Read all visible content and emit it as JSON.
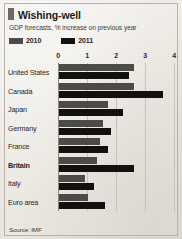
{
  "header": {
    "title": "Wishing-well",
    "subtitle": "GDP forecasts, % increase on previous year"
  },
  "legend": {
    "items": [
      {
        "label": "2010",
        "color": "#4b4a47"
      },
      {
        "label": "2011",
        "color": "#100f0e"
      }
    ]
  },
  "footer": {
    "source": "Source: IMF"
  },
  "colors": {
    "series_2010": "#4b4a47",
    "series_2011": "#100f0e",
    "gridline": "#c9c5bd",
    "axis": "#8d8981",
    "background": "#efece6",
    "text": "#1e1d1a"
  },
  "axis": {
    "ticks": [
      "0",
      "1",
      "2",
      "3",
      "4"
    ],
    "tick_values": [
      0,
      1,
      2,
      3,
      4
    ]
  },
  "chart_data": {
    "type": "bar",
    "orientation": "horizontal",
    "title": "Wishing-well",
    "subtitle": "GDP forecasts, % increase on previous year",
    "xlabel": "",
    "ylabel": "",
    "xlim": [
      0,
      4
    ],
    "grid": true,
    "legend_position": "top-left",
    "source": "Source: IMF",
    "categories": [
      "United States",
      "Canada",
      "Japan",
      "Germany",
      "France",
      "Britain",
      "Italy",
      "Euro area"
    ],
    "highlighted_category": "Britain",
    "series": [
      {
        "name": "2010",
        "color": "#4b4a47",
        "values": [
          2.6,
          2.6,
          1.7,
          1.5,
          1.4,
          1.3,
          0.9,
          1.0
        ]
      },
      {
        "name": "2011",
        "color": "#100f0e",
        "values": [
          2.4,
          3.6,
          2.2,
          1.8,
          1.7,
          2.6,
          1.2,
          1.6
        ]
      }
    ]
  },
  "layout": {
    "label_column_width": 50,
    "row_height": 20
  }
}
